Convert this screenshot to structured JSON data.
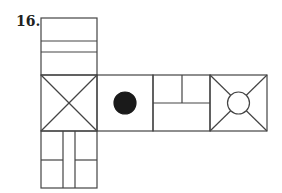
{
  "question": {
    "number": "16."
  },
  "diagram": {
    "type": "cube-net",
    "stroke_color": "#444444",
    "fill_dot_color": "#1a1a1a",
    "faces": [
      {
        "position": "top",
        "pattern": "three horizontal bands"
      },
      {
        "position": "row-1",
        "pattern": "X diagonals"
      },
      {
        "position": "row-2",
        "pattern": "solid black dot"
      },
      {
        "position": "row-3",
        "pattern": "vertical split top half, bottom rectangle"
      },
      {
        "position": "row-4",
        "pattern": "diagonals with open circle in center"
      },
      {
        "position": "bottom",
        "pattern": "center vertical strip with horizontal splits on sides"
      }
    ]
  }
}
